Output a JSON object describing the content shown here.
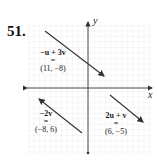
{
  "problem_number": "51.",
  "axes": {
    "x_label": "x",
    "y_label": "y"
  },
  "grid": {
    "color": "#e2e2e2",
    "cells_x": 22,
    "cells_y": 24
  },
  "vectors": [
    {
      "id": "neg-u-plus-3v",
      "expr": "−u + 3v",
      "eq": "=",
      "value": "(11, −8)"
    },
    {
      "id": "neg-2v",
      "expr": "−2v",
      "eq": "=",
      "value": "(−8, 6)"
    },
    {
      "id": "2u-plus-v",
      "expr": "2u + v",
      "eq": "=",
      "value": "(6, −5)"
    }
  ],
  "colors": {
    "arrow": "#333333",
    "axis": "#333333"
  }
}
